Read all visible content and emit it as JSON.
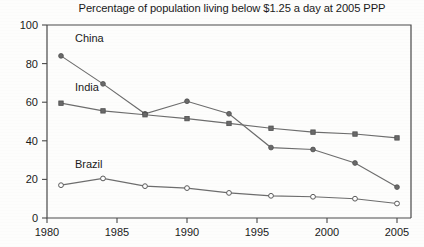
{
  "chart_data": {
    "type": "line",
    "title": "Percentage of population living below $1.25 a day at 2005 PPP",
    "xlabel": "",
    "ylabel": "",
    "x": [
      1981,
      1984,
      1987,
      1990,
      1993,
      1996,
      1999,
      2002,
      2005
    ],
    "xlim": [
      1980,
      2006
    ],
    "ylim": [
      0,
      100
    ],
    "xticks": [
      1980,
      1985,
      1990,
      1995,
      2000,
      2005
    ],
    "xtick_labels": [
      "1980",
      "1985",
      "1990",
      "1995",
      "2000",
      "2005"
    ],
    "yticks": [
      0,
      20,
      40,
      60,
      80,
      100
    ],
    "ytick_labels": [
      "0",
      "20",
      "40",
      "60",
      "80",
      "100"
    ],
    "grid": false,
    "legend_position": "inline-labels",
    "series": [
      {
        "name": "China",
        "label_x": 1982.0,
        "label_y": 91,
        "marker": "filled-circle",
        "values": [
          84.0,
          69.5,
          54.0,
          60.5,
          54.0,
          36.5,
          35.5,
          28.5,
          16.0
        ]
      },
      {
        "name": "India",
        "label_x": 1982.0,
        "label_y": 66,
        "marker": "filled-square",
        "values": [
          59.5,
          55.5,
          53.5,
          51.5,
          49.0,
          46.5,
          44.5,
          43.5,
          41.5
        ]
      },
      {
        "name": "Brazil",
        "label_x": 1982.0,
        "label_y": 26,
        "marker": "open-circle",
        "values": [
          17.0,
          20.5,
          16.5,
          15.5,
          13.0,
          11.5,
          11.0,
          10.0,
          7.5
        ]
      }
    ],
    "colors": {
      "line": "#6d6d6d",
      "axis": "#4a4a4a",
      "text": "#1a1a1a",
      "background": "#fdfdfc"
    }
  }
}
